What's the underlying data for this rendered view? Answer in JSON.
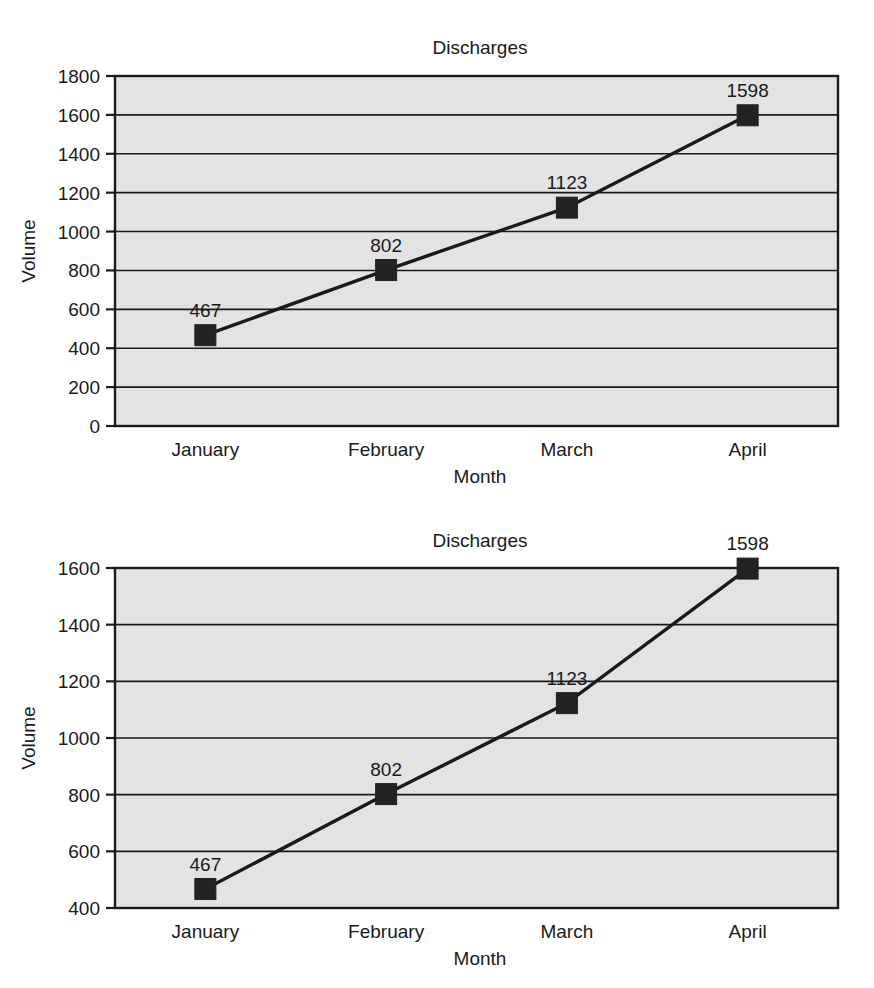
{
  "figure": {
    "panel_count": 2,
    "background_color": "#ffffff",
    "plot_area_color": "#e3e3e3",
    "line_color": "#1a1a1a",
    "marker_color": "#222222"
  },
  "chart_data": [
    {
      "id": "panel-top",
      "type": "line",
      "title": "Discharges",
      "xlabel": "Month",
      "ylabel": "Volume",
      "categories": [
        "January",
        "February",
        "March",
        "April"
      ],
      "values": [
        467,
        802,
        1123,
        1598
      ],
      "point_labels": [
        "467",
        "802",
        "1123",
        "1598"
      ],
      "ylim": [
        0,
        1800
      ],
      "ytick_step": 200,
      "yticks": [
        0,
        200,
        400,
        600,
        800,
        1000,
        1200,
        1400,
        1600,
        1800
      ],
      "ytick_labels": [
        "0",
        "200",
        "400",
        "600",
        "800",
        "1000",
        "1200",
        "1400",
        "1600",
        "1800"
      ],
      "grid": true,
      "legend": false,
      "marker": "square"
    },
    {
      "id": "panel-bottom",
      "type": "line",
      "title": "Discharges",
      "xlabel": "Month",
      "ylabel": "Volume",
      "categories": [
        "January",
        "February",
        "March",
        "April"
      ],
      "values": [
        467,
        802,
        1123,
        1598
      ],
      "point_labels": [
        "467",
        "802",
        "1123",
        "1598"
      ],
      "ylim": [
        400,
        1600
      ],
      "ytick_step": 200,
      "yticks": [
        400,
        600,
        800,
        1000,
        1200,
        1400,
        1600
      ],
      "ytick_labels": [
        "400",
        "600",
        "800",
        "1000",
        "1200",
        "1400",
        "1600"
      ],
      "grid": true,
      "legend": false,
      "marker": "square"
    }
  ]
}
